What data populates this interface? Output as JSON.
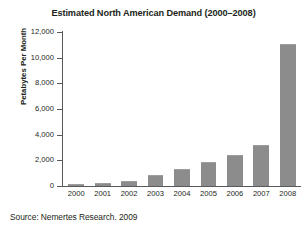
{
  "chart_data": {
    "type": "bar",
    "title": "Estimated North American Demand (2000–2008)",
    "subtitle": "",
    "xlabel": "",
    "ylabel": "Petabytes Per Month",
    "categories": [
      "2000",
      "2001",
      "2002",
      "2003",
      "2004",
      "2005",
      "2006",
      "2007",
      "2008"
    ],
    "values": [
      80,
      150,
      300,
      800,
      1250,
      1800,
      2350,
      3100,
      11000
    ],
    "ylim": [
      0,
      12000
    ],
    "ytick_labels": [
      "12,000",
      "10,000",
      "8,000",
      "6,000",
      "4,000",
      "2,000",
      "0"
    ],
    "ytick_values": [
      12000,
      10000,
      8000,
      6000,
      4000,
      2000,
      0
    ],
    "grid": false,
    "legend": "none",
    "bar_color": "#8c8c8c",
    "axis_color": "#58595b",
    "text_color": "#231f20",
    "background": "#ffffff"
  },
  "source": {
    "text": "Source: Nemertes Research. 2009"
  }
}
